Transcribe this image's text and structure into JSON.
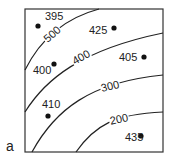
{
  "panel_label": "a",
  "contours": [
    {
      "label": "500",
      "path": "M25,70 C40,40 65,18 99,9",
      "label_x": 52,
      "label_y": 38,
      "label_rot": -42
    },
    {
      "label": "400",
      "path": "M25,112 C45,80 80,50 163,33",
      "label_x": 81,
      "label_y": 61,
      "label_rot": -30
    },
    {
      "label": "300",
      "path": "M32,152 C55,110 90,82 163,75",
      "label_x": 110,
      "label_y": 90,
      "label_rot": -14
    },
    {
      "label": "200",
      "path": "M76,152 C95,125 115,114 163,112",
      "label_x": 119,
      "label_y": 123,
      "label_rot": -12
    }
  ],
  "points": [
    {
      "value": "395",
      "cx": 38,
      "cy": 26,
      "tx": 45,
      "ty": 20
    },
    {
      "value": "425",
      "cx": 114,
      "cy": 28,
      "tx": 89,
      "ty": 34
    },
    {
      "value": "400",
      "cx": 54,
      "cy": 64,
      "tx": 33,
      "ty": 74
    },
    {
      "value": "405",
      "cx": 144,
      "cy": 57,
      "tx": 119,
      "ty": 61
    },
    {
      "value": "410",
      "cx": 48,
      "cy": 116,
      "tx": 42,
      "ty": 108
    },
    {
      "value": "435",
      "cx": 141,
      "cy": 136,
      "tx": 125,
      "ty": 141
    }
  ],
  "frame": {
    "x": 25,
    "y": 9,
    "width": 138,
    "height": 143
  },
  "colors": {
    "line": "#222222",
    "background": "#ffffff"
  }
}
